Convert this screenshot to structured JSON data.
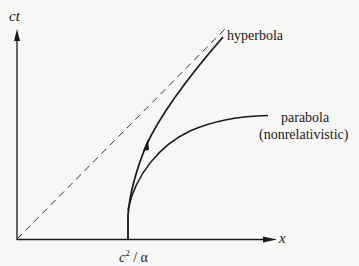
{
  "diagram": {
    "axes": {
      "vertical_label": "ct",
      "horizontal_label": "x"
    },
    "tick_label": {
      "c": "c",
      "exp": "2",
      "rest": " / α"
    },
    "curves": {
      "hyperbola_label": "hyperbola",
      "parabola_label": "parabola",
      "parabola_sublabel": "(nonrelativistic)",
      "asymptote": "light cone (dashed)"
    },
    "colors": {
      "ink": "#1a1a1a",
      "background": "#f7f7f5"
    }
  }
}
